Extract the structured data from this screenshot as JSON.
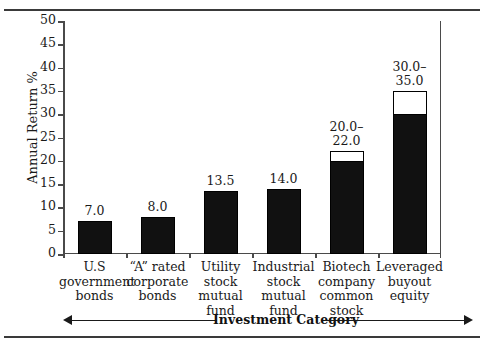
{
  "chart_data": {
    "type": "bar",
    "title": "",
    "xlabel": "Investment Category",
    "ylabel": "Annual Return %",
    "ylim": [
      0,
      50
    ],
    "ytick_step": 5,
    "yticks": [
      0,
      5,
      10,
      15,
      20,
      25,
      30,
      35,
      40,
      45,
      50
    ],
    "grid": false,
    "legend": "none",
    "categories": [
      "U.S government bonds",
      "“A” rated corporate bonds",
      "Utility stock mutual fund",
      "Industrial stock mutual fund",
      "Biotech company common stock",
      "Leveraged buyout equity"
    ],
    "category_lines": [
      [
        "U.S",
        "government",
        "bonds"
      ],
      [
        "“A” rated",
        "corporate",
        "bonds"
      ],
      [
        "Utility",
        "stock",
        "mutual",
        "fund"
      ],
      [
        "Industrial",
        "stock",
        "mutual",
        "fund"
      ],
      [
        "Biotech",
        "company",
        "common",
        "stock"
      ],
      [
        "Leveraged",
        "buyout",
        "equity"
      ]
    ],
    "values": [
      7.0,
      8.0,
      13.5,
      14.0,
      20.0,
      30.0
    ],
    "value_high": [
      7.0,
      8.0,
      13.5,
      14.0,
      22.0,
      35.0
    ],
    "data_labels": [
      "7.0",
      "8.0",
      "13.5",
      "14.0",
      "20.0–\n22.0",
      "30.0–\n35.0"
    ],
    "bars": [
      {
        "label": "7.0",
        "low": 7.0,
        "high": 7.0,
        "range": false
      },
      {
        "label": "8.0",
        "low": 8.0,
        "high": 8.0,
        "range": false
      },
      {
        "label": "13.5",
        "low": 13.5,
        "high": 13.5,
        "range": false
      },
      {
        "label": "14.0",
        "low": 14.0,
        "high": 14.0,
        "range": false
      },
      {
        "label": "20.0–\n22.0",
        "low": 20.0,
        "high": 22.0,
        "range": true
      },
      {
        "label": "30.0–\n35.0",
        "low": 30.0,
        "high": 35.0,
        "range": true
      }
    ],
    "colors": {
      "bar_fill": "#111111",
      "bar_range_fill": "#ffffff",
      "bar_outline": "#000000",
      "axis": "#4a4a4a",
      "text": "#1a1a1a"
    }
  },
  "axis": {
    "y_title": "Annual Return %",
    "x_title": "Investment Category",
    "tick_labels": [
      "50",
      "45",
      "40",
      "35",
      "30",
      "25",
      "20",
      "15",
      "10",
      "5",
      "0"
    ]
  }
}
